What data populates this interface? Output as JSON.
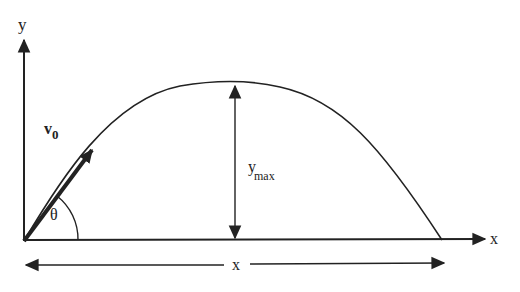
{
  "diagram": {
    "type": "projectile-motion",
    "colors": {
      "stroke": "#222222",
      "background": "#ffffff"
    },
    "axes": {
      "y_label": "y",
      "x_label": "x"
    },
    "velocity": {
      "label_main": "v",
      "label_sub": "0"
    },
    "angle": {
      "label": "θ"
    },
    "max_height": {
      "label_main": "y",
      "label_sub": "max"
    },
    "range": {
      "label": "x"
    }
  }
}
